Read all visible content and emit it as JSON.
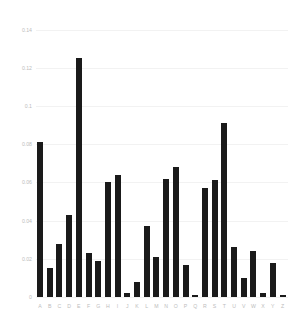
{
  "chart_data": {
    "type": "bar",
    "title": "",
    "subtitle": "",
    "xlabel": "",
    "ylabel": "",
    "categories": [
      "A",
      "B",
      "C",
      "D",
      "E",
      "F",
      "G",
      "H",
      "I",
      "J",
      "K",
      "L",
      "M",
      "N",
      "O",
      "P",
      "Q",
      "R",
      "S",
      "T",
      "U",
      "V",
      "W",
      "X",
      "Y",
      "Z"
    ],
    "values": [
      0.081,
      0.015,
      0.028,
      0.043,
      0.125,
      0.023,
      0.019,
      0.06,
      0.064,
      0.002,
      0.008,
      0.037,
      0.021,
      0.062,
      0.068,
      0.017,
      0.001,
      0.057,
      0.061,
      0.091,
      0.026,
      0.01,
      0.024,
      0.002,
      0.018,
      0.001
    ],
    "values_label": "Relative frequency",
    "ylim": [
      0,
      0.145
    ],
    "yticks": [
      0,
      0.02,
      0.04,
      0.06,
      0.08,
      0.1,
      0.12,
      0.14
    ],
    "ytick_labels": [
      "0",
      "0.02",
      "0.04",
      "0.06",
      "0.08",
      "0.1",
      "0.12",
      "0.14"
    ],
    "grid": true,
    "legend": null,
    "legend_position": "none",
    "bar_color": "#1a1a1a",
    "gridline_color": "#f2f2f2",
    "tick_label_color": "#bdbdbd",
    "background_color": "#ffffff",
    "series": [
      {
        "name": "Letter frequency",
        "values": [
          0.081,
          0.015,
          0.028,
          0.043,
          0.125,
          0.023,
          0.019,
          0.06,
          0.064,
          0.002,
          0.008,
          0.037,
          0.021,
          0.062,
          0.068,
          0.017,
          0.001,
          0.057,
          0.061,
          0.091,
          0.026,
          0.01,
          0.024,
          0.002,
          0.018,
          0.001
        ]
      }
    ]
  }
}
